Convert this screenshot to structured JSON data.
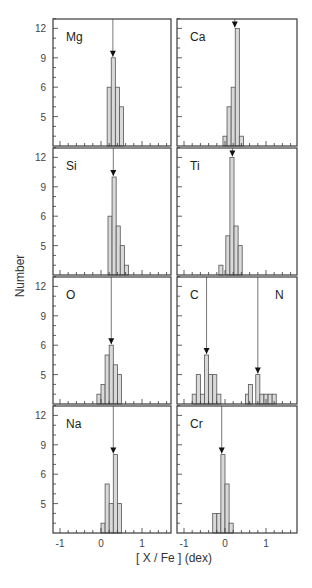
{
  "chart_data": {
    "type": "bar",
    "title": "",
    "xlabel": "[ X / Fe ]  (dex)",
    "ylabel": "Number",
    "xlim": [
      -1.15,
      1.75
    ],
    "ylim": [
      0,
      13.5
    ],
    "x_ticks": [
      -1,
      0,
      1
    ],
    "y_ticks": [
      3,
      6,
      9,
      12
    ],
    "y_tick_labels": [
      "5",
      "6",
      "9",
      "12"
    ],
    "bin_width": 0.1,
    "grid": false,
    "layout": {
      "rows": 4,
      "cols": 2
    },
    "panels": [
      {
        "label": "Mg",
        "row": 0,
        "col": 0,
        "mean": 0.29,
        "bins": [
          {
            "x0": 0.15,
            "count": 6
          },
          {
            "x0": 0.25,
            "count": 9
          },
          {
            "x0": 0.35,
            "count": 6
          },
          {
            "x0": 0.45,
            "count": 4
          }
        ]
      },
      {
        "label": "Ca",
        "row": 0,
        "col": 1,
        "mean": 0.24,
        "bins": [
          {
            "x0": -0.05,
            "count": 1
          },
          {
            "x0": 0.05,
            "count": 4
          },
          {
            "x0": 0.15,
            "count": 6
          },
          {
            "x0": 0.25,
            "count": 12
          },
          {
            "x0": 0.35,
            "count": 1
          }
        ]
      },
      {
        "label": "Si",
        "row": 1,
        "col": 0,
        "mean": 0.3,
        "bins": [
          {
            "x0": 0.17,
            "count": 6
          },
          {
            "x0": 0.27,
            "count": 10
          },
          {
            "x0": 0.37,
            "count": 5
          },
          {
            "x0": 0.47,
            "count": 3
          },
          {
            "x0": 0.57,
            "count": 1
          }
        ]
      },
      {
        "label": "Ti",
        "row": 1,
        "col": 1,
        "mean": 0.18,
        "bins": [
          {
            "x0": -0.15,
            "count": 1
          },
          {
            "x0": 0.02,
            "count": 4
          },
          {
            "x0": 0.12,
            "count": 12
          },
          {
            "x0": 0.22,
            "count": 5
          },
          {
            "x0": 0.32,
            "count": 3
          }
        ]
      },
      {
        "label": "O",
        "row": 2,
        "col": 0,
        "mean": 0.25,
        "bins": [
          {
            "x0": -0.1,
            "count": 1
          },
          {
            "x0": 0.0,
            "count": 2
          },
          {
            "x0": 0.1,
            "count": 5
          },
          {
            "x0": 0.2,
            "count": 6
          },
          {
            "x0": 0.3,
            "count": 4
          },
          {
            "x0": 0.4,
            "count": 3
          }
        ]
      },
      {
        "label": "C",
        "label2": "N",
        "row": 2,
        "col": 1,
        "mean": -0.45,
        "mean2": 0.8,
        "bins": [
          {
            "x0": -0.8,
            "count": 1
          },
          {
            "x0": -0.7,
            "count": 3
          },
          {
            "x0": -0.6,
            "count": 1
          },
          {
            "x0": -0.5,
            "count": 5
          },
          {
            "x0": -0.4,
            "count": 3
          },
          {
            "x0": -0.3,
            "count": 3
          },
          {
            "x0": -0.2,
            "count": 1
          },
          {
            "x0": 0.5,
            "count": 1
          },
          {
            "x0": 0.57,
            "count": 2
          },
          {
            "x0": 0.67,
            "count": 0
          },
          {
            "x0": 0.75,
            "count": 3
          },
          {
            "x0": 0.85,
            "count": 1
          },
          {
            "x0": 0.95,
            "count": 1
          },
          {
            "x0": 1.05,
            "count": 1
          },
          {
            "x0": 1.15,
            "count": 1
          }
        ]
      },
      {
        "label": "Na",
        "row": 3,
        "col": 0,
        "mean": 0.3,
        "bins": [
          {
            "x0": 0.0,
            "count": 1
          },
          {
            "x0": 0.1,
            "count": 5
          },
          {
            "x0": 0.2,
            "count": 3
          },
          {
            "x0": 0.3,
            "count": 8
          },
          {
            "x0": 0.4,
            "count": 3
          }
        ]
      },
      {
        "label": "Cr",
        "row": 3,
        "col": 1,
        "mean": -0.08,
        "bins": [
          {
            "x0": -0.3,
            "count": 2
          },
          {
            "x0": -0.2,
            "count": 2
          },
          {
            "x0": -0.1,
            "count": 8
          },
          {
            "x0": 0.0,
            "count": 5
          },
          {
            "x0": 0.1,
            "count": 1
          }
        ]
      }
    ]
  },
  "labels": {
    "y_axis_title": "Number",
    "x_axis_title": "[ X / Fe ]  (dex)",
    "x_tick_labels": [
      "-1",
      "0",
      "1"
    ],
    "y_tick_labels": [
      "12",
      "9",
      "6",
      "5"
    ]
  },
  "style": {
    "bar_fill": "#d9d9d9",
    "bar_stroke": "#555555",
    "frame": "#3a3a3a",
    "arrow": "#111111"
  }
}
